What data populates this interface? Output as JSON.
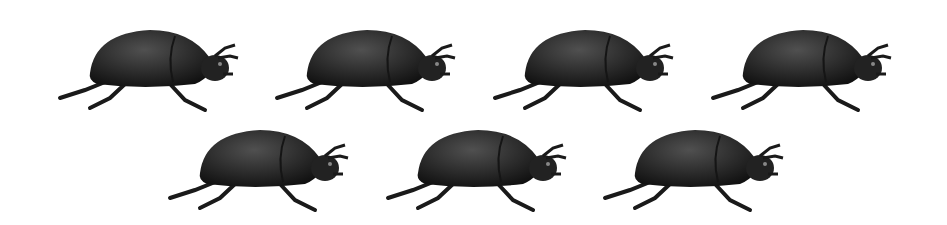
{
  "scene": {
    "subject": "beetle",
    "count": 7,
    "rows": [
      {
        "count": 4,
        "positions": [
          [
            55,
            18
          ],
          [
            272,
            18
          ],
          [
            490,
            18
          ],
          [
            708,
            18
          ]
        ]
      },
      {
        "count": 3,
        "positions": [
          [
            165,
            118
          ],
          [
            383,
            118
          ],
          [
            600,
            118
          ]
        ]
      }
    ],
    "colors": {
      "body": "#2a2a2a",
      "highlight": "#4a4a4a",
      "background": "#ffffff"
    }
  }
}
